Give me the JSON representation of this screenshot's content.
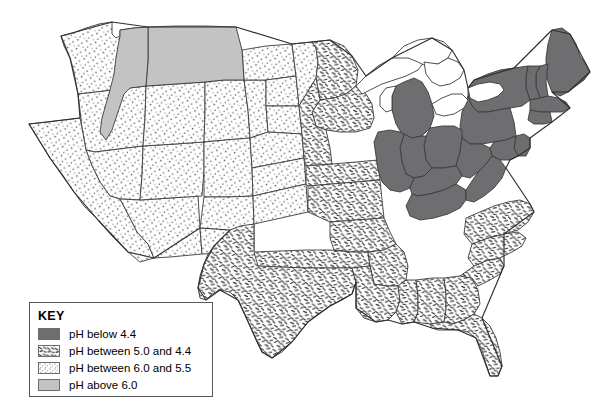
{
  "figure": {
    "kind": "thematic-map",
    "region": "Contiguous United States",
    "background_color": "#ffffff",
    "outline_color": "#3c3c3e"
  },
  "legend": {
    "title": "KEY",
    "border_color": "#58585a",
    "items": [
      {
        "swatch": "solid-dark",
        "label": "pH below 4.4",
        "color": "#6e6e70",
        "pattern": "solid"
      },
      {
        "swatch": "dash",
        "label": "pH between 5.0 and 4.4",
        "color": "#2f2f31",
        "pattern": "short-dashes"
      },
      {
        "swatch": "stipple",
        "label": "pH between 6.0 and 5.5",
        "color": "#58585a",
        "pattern": "fine-dots"
      },
      {
        "swatch": "solid-light",
        "label": "pH above 6.0",
        "color": "#c3c3c3",
        "pattern": "solid"
      }
    ]
  },
  "map_data": {
    "type": "choropleth",
    "classes": [
      {
        "id": "below-4-4",
        "label": "pH below 4.4",
        "fill": "#6e6e70"
      },
      {
        "id": "dash-5-4-4",
        "label": "pH between 5.0 and 4.4",
        "fill": "url(#dashPattern)"
      },
      {
        "id": "dot-6-5-5",
        "label": "pH between 6.0 and 5.5",
        "fill": "url(#dotPattern)"
      },
      {
        "id": "above-6",
        "label": "pH above 6.0",
        "fill": "#c3c3c3"
      }
    ],
    "water_bodies": {
      "label": "Great Lakes",
      "fill": "#ffffff"
    },
    "class_regions": {
      "below-4-4": [
        "Maine",
        "New Hampshire",
        "Vermont",
        "New York",
        "Massachusetts",
        "Connecticut",
        "Rhode Island",
        "Pennsylvania",
        "New Jersey",
        "Michigan",
        "Ohio",
        "Indiana",
        "Illinois (east)",
        "West Virginia",
        "Kentucky",
        "Tennessee (east)",
        "Maryland",
        "Delaware"
      ],
      "dash-5-4-4": [
        "Texas",
        "Oklahoma",
        "Kansas",
        "Missouri",
        "Arkansas",
        "Louisiana",
        "Mississippi",
        "Alabama",
        "Georgia",
        "Florida",
        "South Carolina",
        "North Carolina",
        "Virginia",
        "Iowa",
        "Wisconsin",
        "Minnesota (east)",
        "Nebraska (east)"
      ],
      "dot-6-5-5": [
        "Washington",
        "Oregon",
        "California",
        "Nevada",
        "Arizona",
        "Utah",
        "Idaho (south)",
        "Wyoming",
        "Colorado",
        "New Mexico",
        "North Dakota",
        "South Dakota",
        "Nebraska (west)",
        "Kansas (west)",
        "Minnesota (west)"
      ],
      "above-6": [
        "Montana",
        "Idaho (central)"
      ]
    }
  }
}
